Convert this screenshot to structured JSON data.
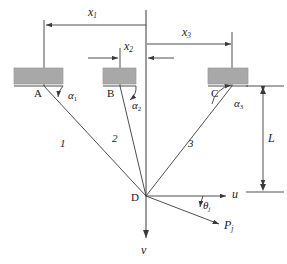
{
  "figure": {
    "type": "engineering-diagram",
    "colors": {
      "line": "#3a3a3a",
      "block_fill": "#a8a8a8",
      "block_stroke": "#8c8c8c",
      "text": "#1a1a1a",
      "background": "#ffffff"
    }
  },
  "anchors": [
    {
      "id": "A",
      "label": "A",
      "x": 44,
      "y": 86
    },
    {
      "id": "B",
      "label": "B",
      "x": 120,
      "y": 86
    },
    {
      "id": "C",
      "label": "C",
      "x": 232,
      "y": 86
    }
  ],
  "joint": {
    "label": "D",
    "x": 146,
    "y": 196
  },
  "cables": [
    {
      "label": "1",
      "from": "A",
      "to": "D",
      "angle_label": "α",
      "angle_sub": "1"
    },
    {
      "label": "2",
      "from": "B",
      "to": "D",
      "angle_label": "α",
      "angle_sub": "2"
    },
    {
      "label": "3",
      "from": "C",
      "to": "D",
      "angle_label": "α",
      "angle_sub": "3"
    }
  ],
  "angle_labels": [
    {
      "base": "α",
      "sub": "1"
    },
    {
      "base": "α",
      "sub": "2"
    },
    {
      "base": "α",
      "sub": "3"
    }
  ],
  "dimensions": [
    {
      "name": "x1",
      "base": "x",
      "sub": "1",
      "orientation": "horizontal",
      "arrow_ends": "left"
    },
    {
      "name": "x2",
      "base": "x",
      "sub": "2",
      "orientation": "horizontal",
      "arrow_ends": "both-inward"
    },
    {
      "name": "x3",
      "base": "x",
      "sub": "3",
      "orientation": "horizontal",
      "arrow_ends": "right"
    },
    {
      "name": "L",
      "base": "L",
      "sub": "",
      "orientation": "vertical",
      "arrow_ends": "both"
    }
  ],
  "axes": [
    {
      "name": "u",
      "label": "u",
      "direction": "horizontal-right"
    },
    {
      "name": "v",
      "label": "v",
      "direction": "vertical-down"
    }
  ],
  "load": {
    "label": "P",
    "sub": "j",
    "angle_label": "θ",
    "angle_sub": "j"
  },
  "cable_numbers": [
    "1",
    "2",
    "3"
  ]
}
